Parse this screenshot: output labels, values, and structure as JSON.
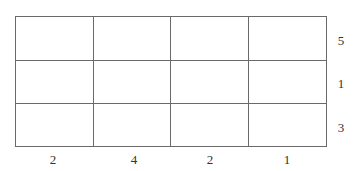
{
  "grid": {
    "rows": 3,
    "columns": 4,
    "line_color": "#6a6a6a",
    "cells": [
      [
        "",
        "",
        "",
        ""
      ],
      [
        "",
        "",
        "",
        ""
      ],
      [
        "",
        "",
        "",
        ""
      ]
    ]
  },
  "column_labels": [
    "2",
    "4",
    "2",
    "1"
  ],
  "row_labels": [
    "5",
    "1",
    "3"
  ]
}
